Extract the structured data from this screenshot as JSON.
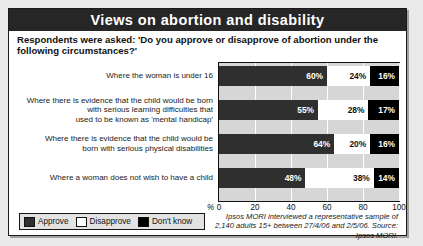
{
  "panel": {
    "title": "Views on abortion and disability",
    "subtitle": "Respondents were asked: 'Do you approve or disapprove of abortion under the following circumstances?'",
    "source_note": "Ipsos MORI interviewed a representative sample of 2,140 adults 15+ between 27/4/06 and 2/5/06. Source: Ipsos MORI.",
    "axis_percent_symbol": "%"
  },
  "legend": {
    "position": "bottom-left",
    "items": [
      {
        "label": "Approve",
        "color": "#2f2f2f",
        "swatch": "approve-swatch"
      },
      {
        "label": "Disapprove",
        "color": "#ffffff",
        "swatch": "disapprove-swatch"
      },
      {
        "label": "Don't know",
        "color": "#000000",
        "swatch": "dontknow-swatch"
      }
    ]
  },
  "chart_data": {
    "type": "bar",
    "orientation": "horizontal",
    "stacked": true,
    "title": "Views on abortion and disability",
    "subtitle": "Respondents were asked: 'Do you approve or disapprove of abortion under the following circumstances?'",
    "xlabel": "%",
    "ylabel": "",
    "xlim": [
      0,
      100
    ],
    "grid": true,
    "gridlines": [
      0,
      20,
      40,
      60,
      80,
      100
    ],
    "tick_labels": [
      "0",
      "20",
      "40",
      "60",
      "80",
      "100"
    ],
    "legend_position": "bottom-left",
    "categories": [
      "Where the woman is under 16",
      "Where there is evidence that the child would be born with serious learning difficulties that used to be known as 'mental handicap'",
      "Where there is evidence that the child would be born with serious physical disabilities",
      "Where a woman does not wish to have a child"
    ],
    "category_lines": [
      [
        "Where the woman is under 16"
      ],
      [
        "Where there is evidence that the child would be born",
        "with serious learning difficulties that",
        "used to be known as 'mental handicap'"
      ],
      [
        "Where there is evidence that the child would be",
        "born with serious physical disabilities"
      ],
      [
        "Where a woman does not wish to have a child"
      ]
    ],
    "series": [
      {
        "name": "Approve",
        "color": "#2f2f2f",
        "values": [
          60,
          55,
          64,
          48
        ]
      },
      {
        "name": "Disapprove",
        "color": "#ffffff",
        "values": [
          24,
          28,
          20,
          38
        ]
      },
      {
        "name": "Don't know",
        "color": "#000000",
        "values": [
          16,
          17,
          16,
          14
        ]
      }
    ],
    "value_labels": [
      [
        "60%",
        "24%",
        "16%"
      ],
      [
        "55%",
        "28%",
        "17%"
      ],
      [
        "64%",
        "20%",
        "16%"
      ],
      [
        "48%",
        "38%",
        "14%"
      ]
    ],
    "annotations": [
      "Ipsos MORI interviewed a representative sample of 2,140 adults 15+ between 27/4/06 and 2/5/06. Source: Ipsos MORI."
    ]
  }
}
